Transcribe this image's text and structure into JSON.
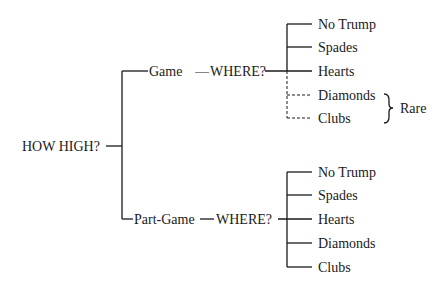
{
  "root": {
    "label": "HOW HIGH?"
  },
  "branches": [
    {
      "label": "Game",
      "connector": "—",
      "question": "WHERE?",
      "options": [
        {
          "label": "No Trump",
          "style": "solid"
        },
        {
          "label": "Spades",
          "style": "solid"
        },
        {
          "label": "Hearts",
          "style": "solid"
        },
        {
          "label": "Diamonds",
          "style": "dashed"
        },
        {
          "label": "Clubs",
          "style": "dashed"
        }
      ],
      "annotation": {
        "label": "Rare",
        "applies_to": [
          "Diamonds",
          "Clubs"
        ]
      }
    },
    {
      "label": "Part-Game",
      "connector": "—",
      "question": "WHERE?",
      "options": [
        {
          "label": "No Trump",
          "style": "solid"
        },
        {
          "label": "Spades",
          "style": "solid"
        },
        {
          "label": "Hearts",
          "style": "solid"
        },
        {
          "label": "Diamonds",
          "style": "solid"
        },
        {
          "label": "Clubs",
          "style": "solid"
        }
      ]
    }
  ]
}
